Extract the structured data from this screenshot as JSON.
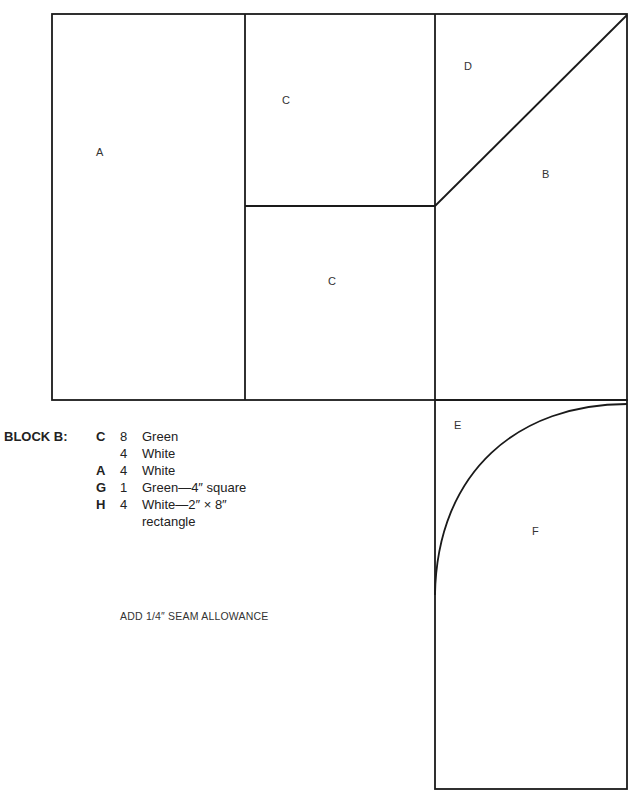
{
  "pieces": [
    {
      "label": "A",
      "x": 96,
      "y": 146
    },
    {
      "label": "C",
      "x": 282,
      "y": 94
    },
    {
      "label": "C",
      "x": 328,
      "y": 275
    },
    {
      "label": "D",
      "x": 464,
      "y": 60
    },
    {
      "label": "B",
      "x": 542,
      "y": 168
    },
    {
      "label": "E",
      "x": 454,
      "y": 419
    },
    {
      "label": "F",
      "x": 532,
      "y": 525
    }
  ],
  "legend": {
    "title": "BLOCK B:",
    "rows": [
      {
        "code": "C",
        "qty": "8",
        "desc": "Green"
      },
      {
        "code": "",
        "qty": "4",
        "desc": "White"
      },
      {
        "code": "A",
        "qty": "4",
        "desc": "White"
      },
      {
        "code": "G",
        "qty": "1",
        "desc": "Green—4″ square"
      },
      {
        "code": "H",
        "qty": "4",
        "desc": "White—2″ × 8″"
      }
    ],
    "continuation": "rectangle"
  },
  "note": "ADD 1/4″ SEAM ALLOWANCE",
  "colors": {
    "line": "#1a1a1a",
    "background": "#ffffff"
  }
}
